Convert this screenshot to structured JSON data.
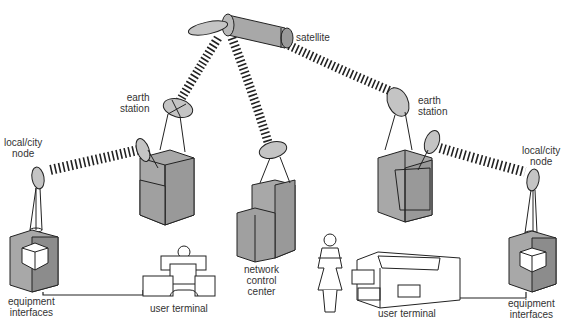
{
  "diagram": {
    "colors": {
      "box_fill": "#a8a8a8",
      "box_dark": "#8c8c8c",
      "stroke": "#222222",
      "beam": "#222222",
      "dish_fill": "#c4c4c4"
    },
    "labels": {
      "satellite": "satellite",
      "earth_station_left_1": "earth",
      "earth_station_left_2": "station",
      "earth_station_right_1": "earth",
      "earth_station_right_2": "station",
      "local_node_left_1": "local/city",
      "local_node_left_2": "node",
      "local_node_right_1": "local/city",
      "local_node_right_2": "node",
      "network_control_1": "network",
      "network_control_2": "control",
      "network_control_3": "center",
      "equipment_left_1": "equipment",
      "equipment_left_2": "interfaces",
      "equipment_right_1": "equipment",
      "equipment_right_2": "interfaces",
      "user_terminal_left": "user terminal",
      "user_terminal_right": "user terminal"
    },
    "nodes": [
      {
        "id": "satellite",
        "label": "satellite"
      },
      {
        "id": "earth-station-left",
        "label": "earth station"
      },
      {
        "id": "earth-station-right",
        "label": "earth station"
      },
      {
        "id": "network-control-center",
        "label": "network control center"
      },
      {
        "id": "local-node-left",
        "label": "local/city node"
      },
      {
        "id": "local-node-right",
        "label": "local/city node"
      },
      {
        "id": "equipment-interfaces-left",
        "label": "equipment interfaces"
      },
      {
        "id": "equipment-interfaces-right",
        "label": "equipment interfaces"
      },
      {
        "id": "user-terminal-left",
        "label": "user terminal"
      },
      {
        "id": "user-terminal-right",
        "label": "user terminal"
      }
    ],
    "links": [
      {
        "from": "satellite",
        "to": "earth-station-left",
        "type": "radio-beam"
      },
      {
        "from": "satellite",
        "to": "network-control-center",
        "type": "radio-beam"
      },
      {
        "from": "satellite",
        "to": "earth-station-right",
        "type": "radio-beam"
      },
      {
        "from": "earth-station-left",
        "to": "local-node-left",
        "type": "radio-beam"
      },
      {
        "from": "earth-station-right",
        "to": "local-node-right",
        "type": "radio-beam"
      },
      {
        "from": "equipment-interfaces-left",
        "to": "user-terminal-left",
        "type": "wire"
      },
      {
        "from": "user-terminal-right",
        "to": "equipment-interfaces-right",
        "type": "wire"
      }
    ]
  }
}
